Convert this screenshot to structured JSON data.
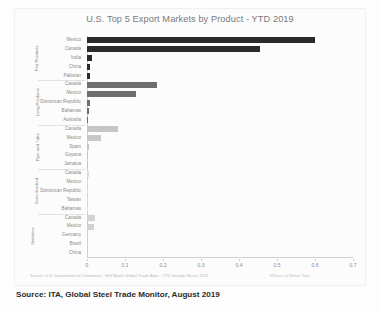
{
  "chart_data": {
    "type": "bar",
    "orientation": "horizontal",
    "title": "U.S. Top 5 Export Markets by Product - YTD 2019",
    "xlabel": "",
    "ylabel": "",
    "xlim": [
      0,
      0.7
    ],
    "xticks": [
      "0",
      "0.1",
      "0.2",
      "0.3",
      "0.4",
      "0.5",
      "0.6",
      "0.7"
    ],
    "xtick_values": [
      0,
      0.1,
      0.2,
      0.3,
      0.4,
      0.5,
      0.6,
      0.7
    ],
    "grid": false,
    "legend": "none",
    "units_note": "Millions of Metric Tons",
    "source_note": "Source: U.S. Department of Commerce - IHS Markit Global Trade Atlas - YTD through March 2019",
    "groups": [
      {
        "name": "Flat Products",
        "color": "#2b2b2b",
        "categories": [
          "Mexico",
          "Canada",
          "India",
          "China",
          "Pakistan"
        ],
        "values": [
          0.6,
          0.455,
          0.012,
          0.009,
          0.008
        ]
      },
      {
        "name": "Long Products",
        "color": "#6e6e6e",
        "categories": [
          "Canada",
          "Mexico",
          "Dominican Republic",
          "Bahamas",
          "Australia"
        ],
        "values": [
          0.185,
          0.128,
          0.009,
          0.004,
          0.003
        ]
      },
      {
        "name": "Pipe and Tube",
        "color": "#c6c6c6",
        "categories": [
          "Canada",
          "Mexico",
          "Spain",
          "Guyana",
          "Jamaica"
        ],
        "values": [
          0.082,
          0.036,
          0.004,
          0.002,
          0.002
        ]
      },
      {
        "name": "Semi-finished",
        "color": "#dcdcdc",
        "categories": [
          "Canada",
          "Mexico",
          "Dominican Republic",
          "Taiwan",
          "Bahamas"
        ],
        "values": [
          0.004,
          0.003,
          0.002,
          0.002,
          0.001
        ]
      },
      {
        "name": "Stainless",
        "color": "#d2d2d2",
        "categories": [
          "Canada",
          "Mexico",
          "Germany",
          "Brazil",
          "China"
        ],
        "values": [
          0.022,
          0.019,
          0.003,
          0.002,
          0.002
        ]
      }
    ]
  },
  "caption": "Source: ITA, Global Steel Trade Monitor, August 2019"
}
